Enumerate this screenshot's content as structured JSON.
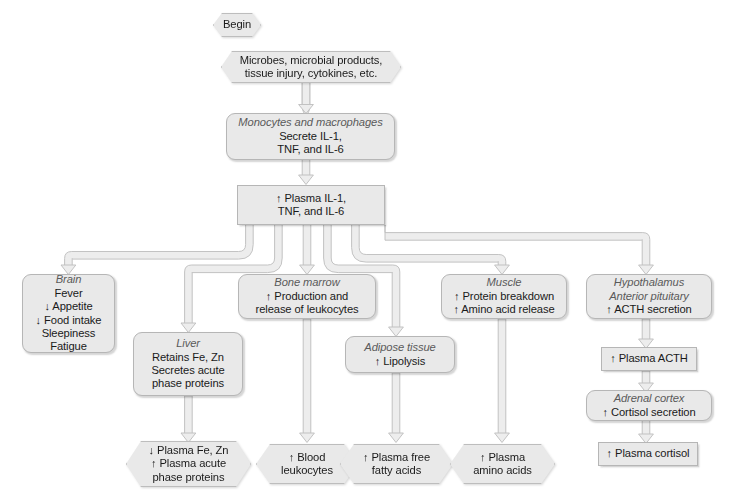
{
  "diagram": {
    "style": {
      "node_fill": "#e9e9e9",
      "node_border": "#b6b6b6",
      "text_color": "#1a1a1a",
      "italic_label_color": "#5a5a5a",
      "connector_fill": "#ededed",
      "connector_stroke": "#c0c0c0",
      "background": "#ffffff"
    },
    "nodes": [
      {
        "id": "begin",
        "shape": "hexagon",
        "lines": [
          {
            "text": "Begin",
            "italic": false
          }
        ]
      },
      {
        "id": "stimuli",
        "shape": "hexagon",
        "lines": [
          {
            "text": "Microbes, microbial products,",
            "italic": false
          },
          {
            "text": "tissue injury, cytokines, etc.",
            "italic": false
          }
        ]
      },
      {
        "id": "monocytes",
        "shape": "rounded",
        "lines": [
          {
            "text": "Monocytes and macrophages",
            "italic": true
          },
          {
            "text": "Secrete IL-1,",
            "italic": false
          },
          {
            "text": "TNF, and IL-6",
            "italic": false
          }
        ]
      },
      {
        "id": "plasma-cytokines",
        "shape": "rect",
        "lines": [
          {
            "text": "↑ Plasma IL-1,",
            "italic": false
          },
          {
            "text": "TNF, and IL-6",
            "italic": false
          }
        ]
      },
      {
        "id": "brain",
        "shape": "rounded",
        "lines": [
          {
            "text": "Brain",
            "italic": true
          },
          {
            "text": "Fever",
            "italic": false
          },
          {
            "text": "↓ Appetite",
            "italic": false
          },
          {
            "text": "↓ Food intake",
            "italic": false
          },
          {
            "text": "Sleepiness",
            "italic": false
          },
          {
            "text": "Fatigue",
            "italic": false
          }
        ]
      },
      {
        "id": "liver",
        "shape": "rounded",
        "lines": [
          {
            "text": "Liver",
            "italic": true
          },
          {
            "text": "Retains Fe, Zn",
            "italic": false
          },
          {
            "text": "Secretes acute",
            "italic": false
          },
          {
            "text": "phase proteins",
            "italic": false
          }
        ]
      },
      {
        "id": "bone-marrow",
        "shape": "rounded",
        "lines": [
          {
            "text": "Bone marrow",
            "italic": true
          },
          {
            "text": "↑ Production and",
            "italic": false
          },
          {
            "text": "release of leukocytes",
            "italic": false
          }
        ]
      },
      {
        "id": "adipose",
        "shape": "rounded",
        "lines": [
          {
            "text": "Adipose tissue",
            "italic": true
          },
          {
            "text": "↑ Lipolysis",
            "italic": false
          }
        ]
      },
      {
        "id": "muscle",
        "shape": "rounded",
        "lines": [
          {
            "text": "Muscle",
            "italic": true
          },
          {
            "text": "↑ Protein breakdown",
            "italic": false
          },
          {
            "text": "↑ Amino acid release",
            "italic": false
          }
        ]
      },
      {
        "id": "hypothalamus",
        "shape": "rounded",
        "lines": [
          {
            "text": "Hypothalamus",
            "italic": true
          },
          {
            "text": "Anterior pituitary",
            "italic": true
          },
          {
            "text": "↑ ACTH secretion",
            "italic": false
          }
        ]
      },
      {
        "id": "plasma-acth",
        "shape": "rect",
        "lines": [
          {
            "text": "↑ Plasma ACTH",
            "italic": false
          }
        ]
      },
      {
        "id": "adrenal-cortex",
        "shape": "rounded",
        "lines": [
          {
            "text": "Adrenal cortex",
            "italic": true
          },
          {
            "text": "↑ Cortisol secretion",
            "italic": false
          }
        ]
      },
      {
        "id": "plasma-cortisol",
        "shape": "rect",
        "lines": [
          {
            "text": "↑ Plasma cortisol",
            "italic": false
          }
        ]
      },
      {
        "id": "plasma-fe-zn",
        "shape": "hexagon",
        "lines": [
          {
            "text": "↓ Plasma Fe, Zn",
            "italic": false
          },
          {
            "text": "↑ Plasma acute",
            "italic": false
          },
          {
            "text": "phase proteins",
            "italic": false
          }
        ]
      },
      {
        "id": "blood-leukocytes",
        "shape": "hexagon",
        "lines": [
          {
            "text": "↑ Blood",
            "italic": false
          },
          {
            "text": "leukocytes",
            "italic": false
          }
        ]
      },
      {
        "id": "plasma-ffa",
        "shape": "hexagon",
        "lines": [
          {
            "text": "↑ Plasma free",
            "italic": false
          },
          {
            "text": "fatty acids",
            "italic": false
          }
        ]
      },
      {
        "id": "plasma-amino-acids",
        "shape": "hexagon",
        "lines": [
          {
            "text": "↑ Plasma",
            "italic": false
          },
          {
            "text": "amino acids",
            "italic": false
          }
        ]
      }
    ]
  }
}
